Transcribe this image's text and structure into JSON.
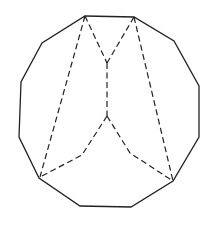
{
  "diagram": {
    "type": "polyhedron-net-projection",
    "colors": {
      "stroke": "#222222",
      "background": "#ffffff"
    },
    "outline_vertices": [
      [
        85,
        16
      ],
      [
        134,
        17
      ],
      [
        174,
        41
      ],
      [
        199,
        86
      ],
      [
        199,
        137
      ],
      [
        173,
        181
      ],
      [
        131,
        207
      ],
      [
        80,
        206
      ],
      [
        39,
        178
      ],
      [
        19,
        137
      ],
      [
        21,
        82
      ],
      [
        42,
        43
      ]
    ],
    "dashed_edges": [
      {
        "name": "left-long-edge",
        "points": [
          [
            85,
            16
          ],
          [
            40,
            177
          ]
        ]
      },
      {
        "name": "top-left-to-upper-junction",
        "points": [
          [
            85,
            16
          ],
          [
            107,
            63
          ]
        ]
      },
      {
        "name": "top-right-to-upper-junction",
        "points": [
          [
            134,
            17
          ],
          [
            107,
            63
          ]
        ]
      },
      {
        "name": "right-long-edge",
        "points": [
          [
            134,
            17
          ],
          [
            173,
            181
          ]
        ]
      },
      {
        "name": "central-vertical-edge",
        "points": [
          [
            107,
            63
          ],
          [
            107,
            116
          ]
        ]
      },
      {
        "name": "lower-left-bent-edge",
        "points": [
          [
            107,
            116
          ],
          [
            82,
            155
          ],
          [
            40,
            177
          ]
        ]
      },
      {
        "name": "lower-right-bent-edge",
        "points": [
          [
            107,
            116
          ],
          [
            130,
            153
          ],
          [
            173,
            181
          ]
        ]
      }
    ]
  }
}
